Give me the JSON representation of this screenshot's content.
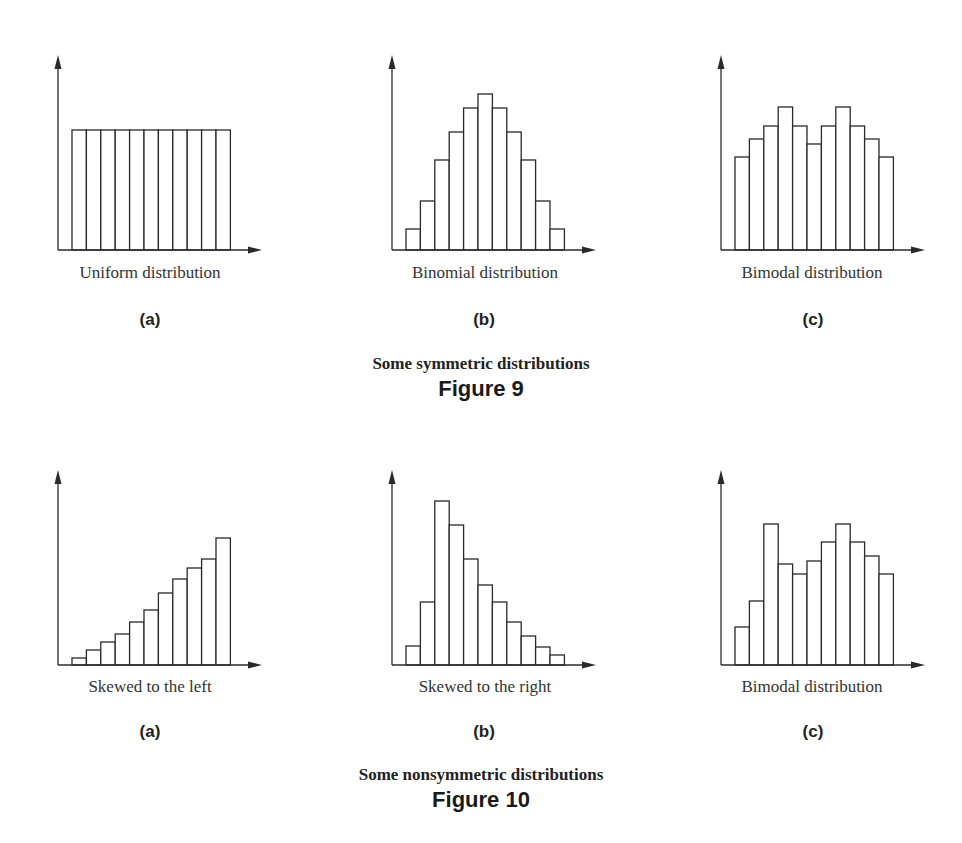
{
  "figure9": {
    "title": "Some symmetric distributions",
    "number": "Figure 9",
    "panels": [
      {
        "letter": "(a)",
        "caption": "Uniform distribution"
      },
      {
        "letter": "(b)",
        "caption": "Binomial distribution"
      },
      {
        "letter": "(c)",
        "caption": "Bimodal distribution"
      }
    ]
  },
  "figure10": {
    "title": "Some nonsymmetric distributions",
    "number": "Figure 10",
    "panels": [
      {
        "letter": "(a)",
        "caption": "Skewed to the left"
      },
      {
        "letter": "(b)",
        "caption": "Skewed to the right"
      },
      {
        "letter": "(c)",
        "caption": "Bimodal distribution"
      }
    ]
  },
  "style": {
    "stroke": "#2a2a2a",
    "fill": "#ffffff"
  },
  "chart_data": [
    {
      "type": "bar",
      "title": "Uniform distribution",
      "panel": "Figure 9 (a)",
      "categories": [
        1,
        2,
        3,
        4,
        5,
        6,
        7,
        8,
        9,
        10,
        11
      ],
      "values": [
        120,
        120,
        120,
        120,
        120,
        120,
        120,
        120,
        120,
        120,
        120
      ],
      "xlabel": "",
      "ylabel": "",
      "ylim": [
        0,
        195
      ],
      "grid": false,
      "axis_ticks": false
    },
    {
      "type": "bar",
      "title": "Binomial distribution",
      "panel": "Figure 9 (b)",
      "categories": [
        1,
        2,
        3,
        4,
        5,
        6,
        7,
        8,
        9,
        10,
        11
      ],
      "values": [
        21,
        49,
        90,
        118,
        142,
        156,
        142,
        118,
        90,
        49,
        21
      ],
      "xlabel": "",
      "ylabel": "",
      "ylim": [
        0,
        195
      ],
      "grid": false,
      "axis_ticks": false
    },
    {
      "type": "bar",
      "title": "Bimodal distribution",
      "panel": "Figure 9 (c)",
      "categories": [
        1,
        2,
        3,
        4,
        5,
        6,
        7,
        8,
        9,
        10,
        11
      ],
      "values": [
        93,
        111,
        124,
        143,
        124,
        106,
        124,
        143,
        124,
        111,
        93
      ],
      "xlabel": "",
      "ylabel": "",
      "ylim": [
        0,
        195
      ],
      "grid": false,
      "axis_ticks": false
    },
    {
      "type": "bar",
      "title": "Skewed to the left",
      "panel": "Figure 10 (a)",
      "categories": [
        1,
        2,
        3,
        4,
        5,
        6,
        7,
        8,
        9,
        10,
        11
      ],
      "values": [
        7,
        15,
        23,
        31,
        43,
        55,
        72,
        86,
        97,
        106,
        127
      ],
      "xlabel": "",
      "ylabel": "",
      "ylim": [
        0,
        192
      ],
      "grid": false,
      "axis_ticks": false
    },
    {
      "type": "bar",
      "title": "Skewed to the right",
      "panel": "Figure 10 (b)",
      "categories": [
        1,
        2,
        3,
        4,
        5,
        6,
        7,
        8,
        9,
        10,
        11
      ],
      "values": [
        19,
        63,
        164,
        140,
        106,
        80,
        63,
        43,
        29,
        18,
        10
      ],
      "xlabel": "",
      "ylabel": "",
      "ylim": [
        0,
        192
      ],
      "grid": false,
      "axis_ticks": false
    },
    {
      "type": "bar",
      "title": "Bimodal distribution",
      "panel": "Figure 10 (c)",
      "categories": [
        1,
        2,
        3,
        4,
        5,
        6,
        7,
        8,
        9,
        10,
        11
      ],
      "values": [
        38,
        64,
        141,
        101,
        91,
        104,
        123,
        141,
        123,
        109,
        91
      ],
      "xlabel": "",
      "ylabel": "",
      "ylim": [
        0,
        192
      ],
      "grid": false,
      "axis_ticks": false
    }
  ]
}
